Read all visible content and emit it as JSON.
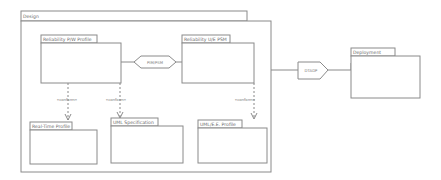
{
  "diagram": {
    "packages": {
      "design": "Design",
      "reliability_pw_profile": "Reliability P/W Profile",
      "reliability_ue_psm": "Reliability U/E PSM",
      "realtime_profile": "Real-Time Profile",
      "uml_specification": "UML Specification",
      "uml_e_profile": "UML/E.E. Profile",
      "deployment": "Deployment"
    },
    "transformations": {
      "pim_psm": "PIM/PSM",
      "dtadp": "DTADP"
    },
    "dependencies": {
      "stereotype": "«conform»"
    }
  }
}
